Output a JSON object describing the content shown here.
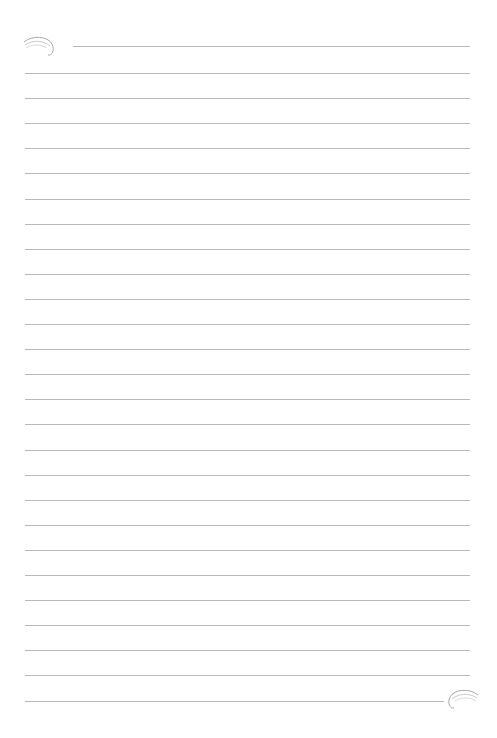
{
  "page": {
    "type": "lined-notepaper",
    "background": "#ffffff",
    "line_color": "#b9b9b9",
    "line_count": 27,
    "line_spacing_px": 25.1,
    "ornaments": [
      "top-left-swirl-icon",
      "bottom-right-swirl-icon"
    ]
  }
}
